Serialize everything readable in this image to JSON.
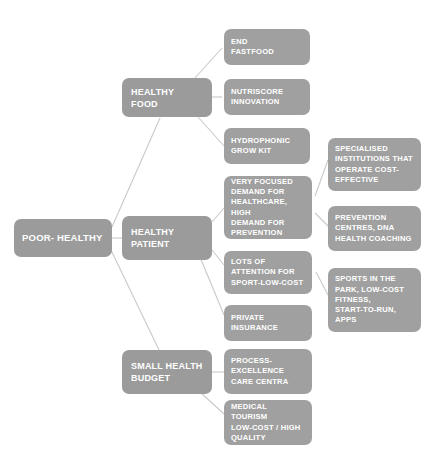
{
  "diagram": {
    "background_color": "#ffffff",
    "node_color": "#9d9d9d",
    "text_color": "#ffffff",
    "edge_color": "#c9c9c9",
    "root": {
      "label": "POOR- HEALTHY"
    },
    "branches": [
      {
        "label": "HEALTHY FOOD",
        "children": [
          {
            "label": "END\nFASTFOOD",
            "children": []
          },
          {
            "label": "NUTRISCORE\nINNOVATION",
            "children": []
          },
          {
            "label": "HYDROPHONIC\nGROW KIT",
            "children": []
          }
        ]
      },
      {
        "label": "HEALTHY\nPATIENT",
        "children": [
          {
            "label": "VERY FOCUSED\nDEMAND FOR\nHEALTHCARE, HIGH\nDEMAND FOR\nPREVENTION",
            "children": [
              {
                "label": "SPECIALISED\nINSTITUTIONS THAT\nOPERATE COST-\nEFFECTIVE"
              },
              {
                "label": "PREVENTION\nCENTRES, DNA\nHEALTH COACHING"
              }
            ]
          },
          {
            "label": "LOTS OF\nATTENTION FOR\nSPORT-LOW-COST",
            "children": [
              {
                "label": "SPORTS IN THE\nPARK, LOW-COST\nFITNESS,\nSTART-TO-RUN,\nAPPS"
              }
            ]
          },
          {
            "label": "PRIVATE\nINSURANCE",
            "children": []
          }
        ]
      },
      {
        "label": "SMALL HEALTH\nBUDGET",
        "children": [
          {
            "label": "PROCESS-\nEXCELLENCE\nCARE CENTRA",
            "children": []
          },
          {
            "label": "MEDICAL TOURISM\nLOW-COST / HIGH\nQUALITY",
            "children": []
          }
        ]
      }
    ]
  }
}
